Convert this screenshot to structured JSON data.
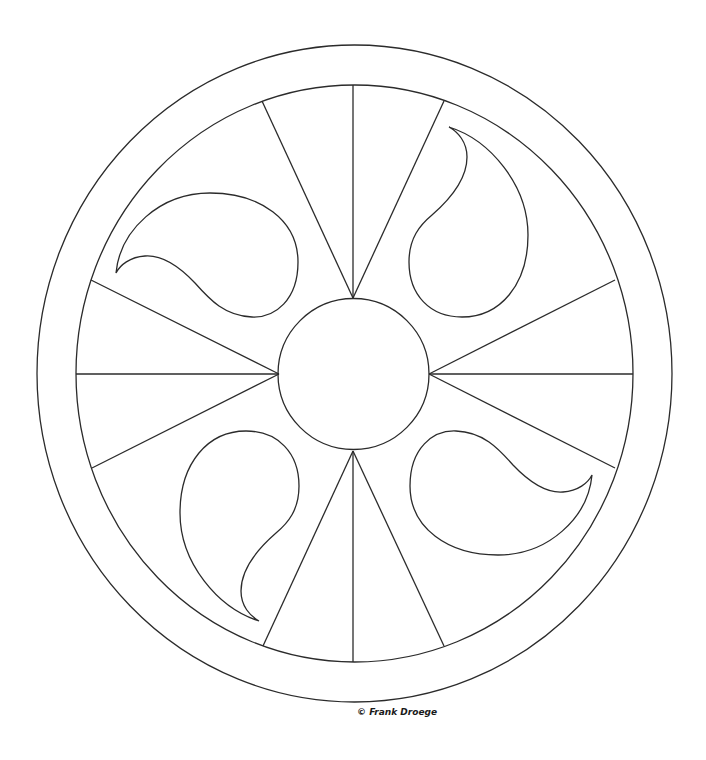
{
  "artwork": {
    "type": "mandala-coloring-page",
    "center": [
      354,
      374
    ],
    "outer_ring": {
      "rx": 317.5,
      "ry": 328.5
    },
    "inner_ring": {
      "rx": 278.5,
      "ry": 288.5
    },
    "hub_circle": {
      "r": 76
    },
    "spokes": [
      {
        "from": [
          353,
          298
        ],
        "to": [
          353,
          85
        ]
      },
      {
        "from": [
          353,
          298
        ],
        "to": [
          262,
          101
        ]
      },
      {
        "from": [
          353,
          298
        ],
        "to": [
          444,
          101
        ]
      },
      {
        "from": [
          353,
          451
        ],
        "to": [
          353,
          662
        ]
      },
      {
        "from": [
          353,
          451
        ],
        "to": [
          263,
          646
        ]
      },
      {
        "from": [
          353,
          451
        ],
        "to": [
          444,
          646
        ]
      },
      {
        "from": [
          279,
          374
        ],
        "to": [
          76,
          374
        ]
      },
      {
        "from": [
          279,
          374
        ],
        "to": [
          91,
          280
        ]
      },
      {
        "from": [
          279,
          374
        ],
        "to": [
          92,
          468
        ]
      },
      {
        "from": [
          429,
          374
        ],
        "to": [
          633,
          374
        ]
      },
      {
        "from": [
          429,
          374
        ],
        "to": [
          615,
          280
        ]
      },
      {
        "from": [
          429,
          374
        ],
        "to": [
          615,
          468
        ]
      }
    ],
    "paisley_count": 4,
    "stroke_color": "#2b2b2b",
    "background_color": "#ffffff"
  },
  "credit": {
    "text": "© Frank Droege"
  }
}
